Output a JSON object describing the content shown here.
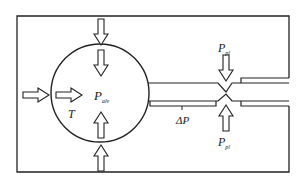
{
  "diagram": {
    "type": "lung-airway-pressure-schematic",
    "colors": {
      "stroke": "#222222",
      "background": "#ffffff"
    },
    "labels": {
      "alveolar_pressure": {
        "main": "P",
        "sub": "alv"
      },
      "tension": "T",
      "pressure_drop": "ΔP",
      "pleural_pressure_top": {
        "main": "P",
        "sub": "pl"
      },
      "pleural_pressure_bottom": {
        "main": "P",
        "sub": "pl"
      }
    },
    "elements": {
      "frame": "chest-wall-boundary",
      "alveolus": "circle",
      "airway": "tube-with-constriction",
      "arrows": [
        "outer-left-arrow-right",
        "inner-left-arrow-right",
        "outer-top-arrow-down",
        "inner-top-arrow-down",
        "inner-bottom-arrow-up",
        "outer-bottom-arrow-up",
        "pleural-top-arrow-down",
        "pleural-bottom-arrow-up"
      ]
    }
  }
}
